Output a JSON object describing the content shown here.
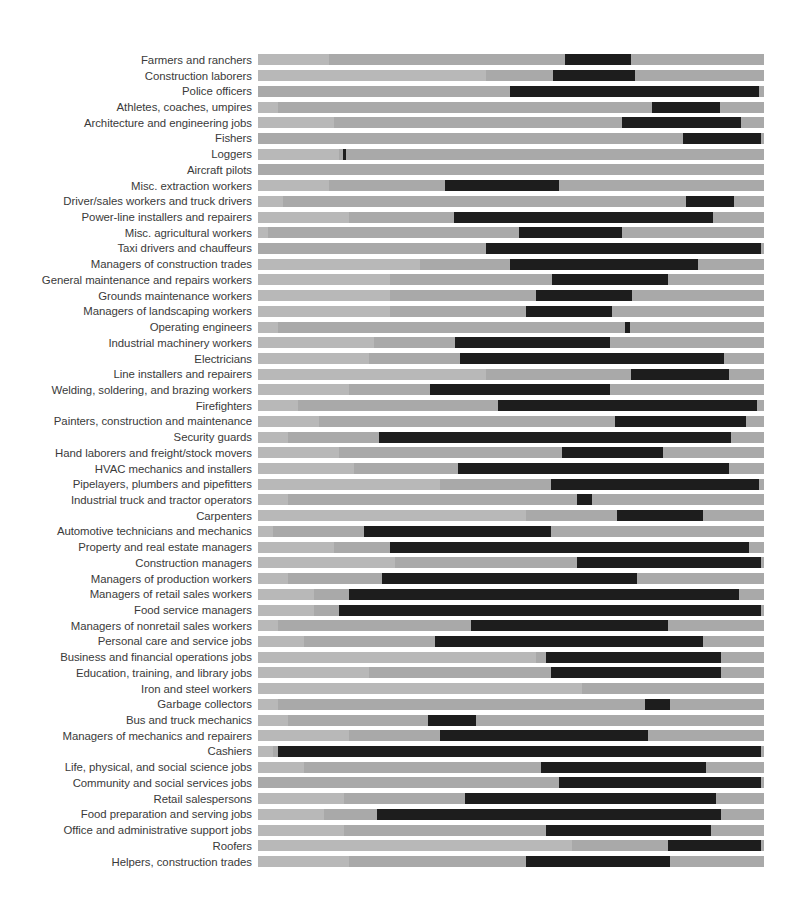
{
  "chart_data": {
    "type": "bar",
    "title": "",
    "subtitle": "",
    "xlabel": "",
    "ylabel": "",
    "xlim": [
      0,
      100
    ],
    "grid": false,
    "legend": null,
    "orientation": "horizontal",
    "track_color": "#a9a9a9",
    "track_shade_color": "#b8b8b8",
    "segment_color": "#1d1d1d",
    "background_color": "#ffffff",
    "label_color": "#3a3a3a",
    "categories": [
      "Farmers and ranchers",
      "Construction laborers",
      "Police officers",
      "Athletes, coaches, umpires",
      "Architecture and engineering jobs",
      "Fishers",
      "Loggers",
      "Aircraft pilots",
      "Misc. extraction workers",
      "Driver/sales workers and truck drivers",
      "Power-line installers and repairers",
      "Misc. agricultural workers",
      "Taxi drivers and chauffeurs",
      "Managers of construction trades",
      "General maintenance and repairs workers",
      "Grounds maintenance workers",
      "Managers of landscaping workers",
      "Operating engineers",
      "Industrial machinery workers",
      "Electricians",
      "Line installers and repairers",
      "Welding, soldering, and brazing workers",
      "Firefighters",
      "Painters, construction and maintenance",
      "Security guards",
      "Hand laborers and freight/stock movers",
      "HVAC mechanics and installers",
      "Pipelayers, plumbers and pipefitters",
      "Industrial truck and tractor operators",
      "Carpenters",
      "Automotive technicians and mechanics",
      "Property and real estate managers",
      "Construction managers",
      "Managers of production workers",
      "Managers of retail sales workers",
      "Food service managers",
      "Managers of nonretail sales workers",
      "Personal care and service jobs",
      "Business and financial operations jobs",
      "Education, training, and library jobs",
      "Iron and steel workers",
      "Garbage collectors",
      "Bus and truck mechanics",
      "Managers of mechanics and repairers",
      "Cashiers",
      "Life, physical, and social science jobs",
      "Community and social services jobs",
      "Retail salespersons",
      "Food preparation and serving jobs",
      "Office and administrative support jobs",
      "Roofers",
      "Helpers, construction trades"
    ],
    "segments": [
      {
        "category": "Farmers and ranchers",
        "start": 60.7,
        "end": 73.7,
        "shade_start": 0.0,
        "shade_end": 14.0
      },
      {
        "category": "Construction laborers",
        "start": 58.3,
        "end": 74.6,
        "shade_start": 0.0,
        "shade_end": 45.0
      },
      {
        "category": "Police officers",
        "start": 49.8,
        "end": 99.0,
        "shade_start": 0.0,
        "shade_end": 0.0
      },
      {
        "category": "Athletes, coaches, umpires",
        "start": 77.9,
        "end": 91.3,
        "shade_start": 0.0,
        "shade_end": 4.0
      },
      {
        "category": "Architecture and engineering jobs",
        "start": 72.0,
        "end": 95.5,
        "shade_start": 0.0,
        "shade_end": 15.0
      },
      {
        "category": "Fishers",
        "start": 84.0,
        "end": 99.5,
        "shade_start": 0.0,
        "shade_end": 0.0
      },
      {
        "category": "Loggers",
        "start": 16.8,
        "end": 17.4,
        "shade_start": 0.0,
        "shade_end": 16.0
      },
      {
        "category": "Aircraft pilots",
        "start": 0.0,
        "end": 0.0,
        "shade_start": 0.0,
        "shade_end": 0.0
      },
      {
        "category": "Misc. extraction workers",
        "start": 37.0,
        "end": 59.5,
        "shade_start": 0.0,
        "shade_end": 14.0
      },
      {
        "category": "Driver/sales workers and truck drivers",
        "start": 84.5,
        "end": 94.0,
        "shade_start": 0.0,
        "shade_end": 5.0
      },
      {
        "category": "Power-line installers and repairers",
        "start": 38.8,
        "end": 90.0,
        "shade_start": 0.0,
        "shade_end": 18.0
      },
      {
        "category": "Misc. agricultural workers",
        "start": 51.6,
        "end": 72.0,
        "shade_start": 0.0,
        "shade_end": 2.0
      },
      {
        "category": "Taxi drivers and chauffeurs",
        "start": 45.0,
        "end": 99.5,
        "shade_start": 0.0,
        "shade_end": 0.0
      },
      {
        "category": "Managers of construction trades",
        "start": 49.8,
        "end": 87.0,
        "shade_start": 0.0,
        "shade_end": 32.0
      },
      {
        "category": "General maintenance and repairs workers",
        "start": 58.2,
        "end": 81.0,
        "shade_start": 0.0,
        "shade_end": 26.0
      },
      {
        "category": "Grounds maintenance workers",
        "start": 55.0,
        "end": 74.0,
        "shade_start": 0.0,
        "shade_end": 26.0
      },
      {
        "category": "Managers of landscaping workers",
        "start": 53.0,
        "end": 70.0,
        "shade_start": 0.0,
        "shade_end": 26.0
      },
      {
        "category": "Operating engineers",
        "start": 72.5,
        "end": 73.5,
        "shade_start": 0.0,
        "shade_end": 4.0
      },
      {
        "category": "Industrial machinery workers",
        "start": 39.0,
        "end": 69.5,
        "shade_start": 0.0,
        "shade_end": 23.0
      },
      {
        "category": "Electricians",
        "start": 40.0,
        "end": 92.0,
        "shade_start": 0.0,
        "shade_end": 22.0
      },
      {
        "category": "Line installers and repairers",
        "start": 73.8,
        "end": 93.0,
        "shade_start": 0.0,
        "shade_end": 45.0
      },
      {
        "category": "Welding, soldering, and brazing workers",
        "start": 34.0,
        "end": 69.5,
        "shade_start": 0.0,
        "shade_end": 18.0
      },
      {
        "category": "Firefighters",
        "start": 47.5,
        "end": 98.6,
        "shade_start": 0.0,
        "shade_end": 8.0
      },
      {
        "category": "Painters, construction and maintenance",
        "start": 70.5,
        "end": 96.5,
        "shade_start": 0.0,
        "shade_end": 12.0
      },
      {
        "category": "Security guards",
        "start": 24.0,
        "end": 93.5,
        "shade_start": 0.0,
        "shade_end": 6.0
      },
      {
        "category": "Hand laborers and freight/stock movers",
        "start": 60.0,
        "end": 80.0,
        "shade_start": 0.0,
        "shade_end": 16.0
      },
      {
        "category": "HVAC mechanics and installers",
        "start": 39.5,
        "end": 93.0,
        "shade_start": 0.0,
        "shade_end": 19.0
      },
      {
        "category": "Pipelayers, plumbers and pipefitters",
        "start": 58.0,
        "end": 99.0,
        "shade_start": 0.0,
        "shade_end": 36.0
      },
      {
        "category": "Industrial truck and tractor operators",
        "start": 63.0,
        "end": 66.0,
        "shade_start": 0.0,
        "shade_end": 6.0
      },
      {
        "category": "Carpenters",
        "start": 71.0,
        "end": 88.0,
        "shade_start": 0.0,
        "shade_end": 53.0
      },
      {
        "category": "Automotive technicians and mechanics",
        "start": 21.0,
        "end": 58.0,
        "shade_start": 0.0,
        "shade_end": 3.0
      },
      {
        "category": "Property and real estate managers",
        "start": 26.0,
        "end": 97.0,
        "shade_start": 0.0,
        "shade_end": 15.0
      },
      {
        "category": "Construction managers",
        "start": 63.0,
        "end": 99.5,
        "shade_start": 0.0,
        "shade_end": 27.0
      },
      {
        "category": "Managers of production workers",
        "start": 24.5,
        "end": 75.0,
        "shade_start": 0.0,
        "shade_end": 6.0
      },
      {
        "category": "Managers of retail sales workers",
        "start": 18.0,
        "end": 95.0,
        "shade_start": 0.0,
        "shade_end": 11.0
      },
      {
        "category": "Food service managers",
        "start": 16.0,
        "end": 99.5,
        "shade_start": 0.0,
        "shade_end": 11.0
      },
      {
        "category": "Managers of nonretail sales workers",
        "start": 42.0,
        "end": 81.0,
        "shade_start": 0.0,
        "shade_end": 4.0
      },
      {
        "category": "Personal care and service jobs",
        "start": 35.0,
        "end": 88.0,
        "shade_start": 0.0,
        "shade_end": 9.0
      },
      {
        "category": "Business and financial operations jobs",
        "start": 57.0,
        "end": 91.5,
        "shade_start": 0.0,
        "shade_end": 55.0
      },
      {
        "category": "Education, training, and library jobs",
        "start": 58.0,
        "end": 91.5,
        "shade_start": 0.0,
        "shade_end": 22.0
      },
      {
        "category": "Iron and steel workers",
        "start": 0.0,
        "end": 0.0,
        "shade_start": 0.0,
        "shade_end": 64.0
      },
      {
        "category": "Garbage collectors",
        "start": 76.5,
        "end": 81.5,
        "shade_start": 0.0,
        "shade_end": 4.0
      },
      {
        "category": "Bus and truck mechanics",
        "start": 33.5,
        "end": 43.0,
        "shade_start": 0.0,
        "shade_end": 6.0
      },
      {
        "category": "Managers of mechanics and repairers",
        "start": 36.0,
        "end": 77.0,
        "shade_start": 0.0,
        "shade_end": 18.0
      },
      {
        "category": "Cashiers",
        "start": 4.0,
        "end": 99.5,
        "shade_start": 0.0,
        "shade_end": 3.0
      },
      {
        "category": "Life, physical, and social science jobs",
        "start": 56.0,
        "end": 88.5,
        "shade_start": 0.0,
        "shade_end": 9.0
      },
      {
        "category": "Community and social services jobs",
        "start": 59.5,
        "end": 99.5,
        "shade_start": 0.0,
        "shade_end": 0.0
      },
      {
        "category": "Retail salespersons",
        "start": 41.0,
        "end": 90.5,
        "shade_start": 0.0,
        "shade_end": 17.0
      },
      {
        "category": "Food preparation and serving jobs",
        "start": 23.5,
        "end": 91.5,
        "shade_start": 0.0,
        "shade_end": 13.0
      },
      {
        "category": "Office and administrative support jobs",
        "start": 57.0,
        "end": 89.5,
        "shade_start": 0.0,
        "shade_end": 17.0
      },
      {
        "category": "Roofers",
        "start": 81.0,
        "end": 99.5,
        "shade_start": 0.0,
        "shade_end": 62.0
      },
      {
        "category": "Helpers, construction trades",
        "start": 53.0,
        "end": 81.5,
        "shade_start": 0.0,
        "shade_end": 18.0
      }
    ]
  }
}
